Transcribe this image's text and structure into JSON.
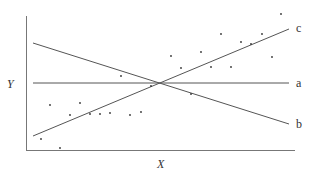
{
  "diagram": {
    "axis_labels": {
      "x": "X",
      "y": "Y"
    },
    "lines": [
      {
        "label": "a",
        "x1": 33,
        "y1": 83,
        "x2": 289,
        "y2": 83,
        "lx": 296,
        "ly": 87
      },
      {
        "label": "b",
        "x1": 33,
        "y1": 43,
        "x2": 289,
        "y2": 124,
        "lx": 296,
        "ly": 128
      },
      {
        "label": "c",
        "x1": 33,
        "y1": 136,
        "x2": 289,
        "y2": 29,
        "lx": 296,
        "ly": 32
      }
    ],
    "points": [
      [
        41,
        139
      ],
      [
        50,
        105
      ],
      [
        60,
        148
      ],
      [
        70,
        115
      ],
      [
        80,
        103
      ],
      [
        90,
        114
      ],
      [
        100,
        114
      ],
      [
        110,
        113
      ],
      [
        121,
        76
      ],
      [
        130,
        115
      ],
      [
        141,
        112
      ],
      [
        151,
        86
      ],
      [
        171,
        56
      ],
      [
        181,
        68
      ],
      [
        191,
        94
      ],
      [
        201,
        52
      ],
      [
        211,
        67
      ],
      [
        221,
        34
      ],
      [
        231,
        67
      ],
      [
        241,
        42
      ],
      [
        251,
        44
      ],
      [
        262,
        34
      ],
      [
        272,
        57
      ],
      [
        281,
        14
      ]
    ],
    "colors": {
      "line": "#555555",
      "point": "#333333",
      "axis": "#777777"
    }
  }
}
